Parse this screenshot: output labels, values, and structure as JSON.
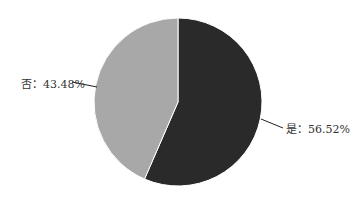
{
  "chart_data": {
    "type": "pie",
    "title": "",
    "categories": [
      "是",
      "否"
    ],
    "values": [
      56.52,
      43.48
    ],
    "labels": [
      "是：56.52%",
      "否：43.48%"
    ],
    "colors": [
      "#2a2a2a",
      "#a8a8a8"
    ],
    "start_angle": "12 o'clock, clockwise"
  }
}
